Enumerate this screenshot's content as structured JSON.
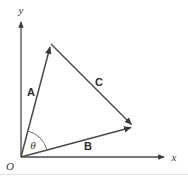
{
  "figure": {
    "type": "vector-triangle-diagram",
    "background_color": "#ffffff",
    "stroke_color": "#4a4a4a",
    "label_color": "#2b2b2b",
    "axes": {
      "origin_label": "O",
      "x_label": "x",
      "y_label": "y",
      "origin_px": [
        21,
        157
      ],
      "x_axis_tip_px": [
        166,
        157
      ],
      "y_axis_tip_px": [
        21,
        20
      ]
    },
    "vectors": [
      {
        "name": "A",
        "label": "A",
        "from_px": [
          21,
          157
        ],
        "to_px": [
          51,
          44
        ],
        "label_px": [
          31,
          92
        ],
        "arrowhead": "at-tip"
      },
      {
        "name": "B",
        "label": "B",
        "from_px": [
          21,
          157
        ],
        "to_px": [
          134,
          127
        ],
        "label_px": [
          88,
          146
        ],
        "arrowhead": "at-tip"
      },
      {
        "name": "C",
        "label": "C",
        "from_px": [
          51,
          44
        ],
        "to_px": [
          134,
          127
        ],
        "label_px": [
          99,
          82
        ],
        "arrowhead": "at-tip"
      }
    ],
    "angle": {
      "label": "θ",
      "label_px": [
        33,
        145
      ],
      "vertex_px": [
        21,
        157
      ],
      "radius_px": 27,
      "between": [
        "B",
        "A"
      ],
      "start_deg": 15,
      "end_deg": 75
    }
  }
}
